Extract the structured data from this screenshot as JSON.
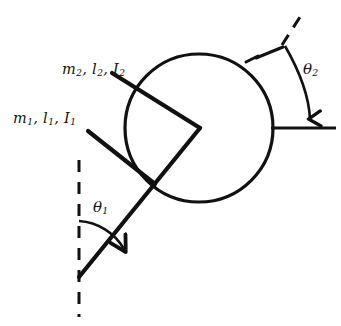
{
  "figure": {
    "kind": "mechanics-free-body-diagram",
    "background_color": "#ffffff",
    "stroke_color": "#111111"
  },
  "labels": {
    "rod1": {
      "mass": "m",
      "mass_sub": "1",
      "length": "l",
      "length_sub": "1",
      "inertia": "I",
      "inertia_sub": "1",
      "sep": ", "
    },
    "rod2": {
      "mass": "m",
      "mass_sub": "2",
      "length": "l",
      "length_sub": "2",
      "inertia": "I",
      "inertia_sub": "2",
      "sep": ", "
    },
    "theta1": {
      "symbol": "θ",
      "sub": "1"
    },
    "theta2": {
      "symbol": "θ",
      "sub": "2"
    }
  },
  "geometry": {
    "disk": {
      "center_x": 199,
      "center_y": 128,
      "radius": 74,
      "stroke_width": 3.2
    },
    "joint_vertex": {
      "x": 200,
      "y": 128
    },
    "rod1": {
      "pivot_x": 79,
      "pivot_y": 277,
      "tip_x": 88,
      "tip_y": 131,
      "through_x": 200,
      "through_y": 128,
      "stroke_width": 4.0
    },
    "rod2": {
      "tip_x": 112,
      "tip_y": 73,
      "vertex_x": 200,
      "vertex_y": 128,
      "stroke_width": 4.0
    },
    "vertical_dashed_reference": {
      "x": 79,
      "y_top": 160,
      "y_bottom": 317,
      "dash_pattern": "11 9",
      "stroke_width": 3.0
    },
    "theta1_arc": {
      "cx": 79,
      "cy": 277,
      "radius": 56,
      "start_angle_deg": -90,
      "end_angle_deg": -36,
      "arrow_at": "end"
    },
    "disk_dashed_reference": {
      "x1": 299,
      "y1": 18,
      "x2": 283,
      "y2": 46,
      "dash_pattern": "12 9",
      "stroke_width": 3.0
    },
    "disk_ref_solid": {
      "x1": 281,
      "y1": 48,
      "x2": 250,
      "y2": 61,
      "stroke_width": 3.0
    },
    "theta2_arc": {
      "from_x": 285,
      "from_y": 45,
      "to_x": 310,
      "to_y": 124,
      "arrow_at": "end"
    },
    "horizontal_reference": {
      "x1": 273,
      "x2": 336,
      "y": 128,
      "stroke_width": 3.0
    }
  }
}
